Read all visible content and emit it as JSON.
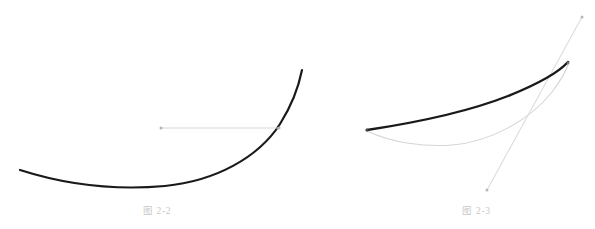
{
  "page": {
    "background_color": "#ffffff",
    "width": 595,
    "height": 229
  },
  "figures": [
    {
      "id": "figure-2-2",
      "caption": "图 2-2",
      "caption_color": "#c9c9c9",
      "elements": {
        "main_curve": {
          "name": "convex-curve",
          "color": "#1a1a1a",
          "stroke_width": 2.2,
          "description": "U-shaped convex curve rising steeply to the right",
          "path": "M 20,170 C 70,186 120,190 165,186 C 215,181 258,158 280,124 C 292,105 299,85 302,70"
        },
        "secant_line": {
          "name": "horizontal-chord",
          "color": "#d8d8d8",
          "stroke_width": 1.1,
          "description": "horizontal light gray chord with endpoint dots",
          "x1": 161,
          "y1": 128,
          "x2": 279,
          "y2": 128
        },
        "endpoint_dots": [
          {
            "name": "chord-left-endpoint",
            "cx": 161,
            "cy": 128,
            "r": 1.5,
            "color": "#b5b5b5"
          },
          {
            "name": "chord-right-endpoint",
            "cx": 279,
            "cy": 128,
            "r": 1.5,
            "color": "#b5b5b5"
          }
        ]
      }
    },
    {
      "id": "figure-2-3",
      "caption": "图 2-3",
      "caption_color": "#c9c9c9",
      "elements": {
        "main_curve": {
          "name": "concave-curve",
          "color": "#1a1a1a",
          "stroke_width": 2.4,
          "description": "thick black curve rising from lower-left to upper-right",
          "path": "M 37,130 C 90,122 140,111 178,96 C 208,84 227,74 238,62"
        },
        "lower_curve": {
          "name": "lower-arc-curve",
          "color": "#d5d5d5",
          "stroke_width": 1.1,
          "description": "thin gray arc dipping below the main curve and rejoining near the top",
          "path": "M 37,131 C 62,143 95,147 122,145 C 160,142 200,120 222,92 C 232,79 237,69 239,62"
        },
        "tangent_line": {
          "name": "tangent-line",
          "color": "#dcdcdc",
          "stroke_width": 1.1,
          "description": "thin gray straight line crossing the curves, with dots at both ends",
          "x1": 157,
          "y1": 190,
          "x2": 252,
          "y2": 17
        },
        "endpoint_dots": [
          {
            "name": "tangent-lower-endpoint",
            "cx": 157,
            "cy": 190,
            "r": 1.5,
            "color": "#b8b8b8"
          },
          {
            "name": "tangent-upper-endpoint",
            "cx": 252,
            "cy": 17,
            "r": 1.5,
            "color": "#b8b8b8"
          },
          {
            "name": "curve-left-endpoint",
            "cx": 37,
            "cy": 130,
            "r": 1.6,
            "color": "#444444"
          },
          {
            "name": "curve-intersection-point",
            "cx": 238,
            "cy": 63,
            "r": 1.4,
            "color": "#777777"
          }
        ]
      }
    }
  ]
}
